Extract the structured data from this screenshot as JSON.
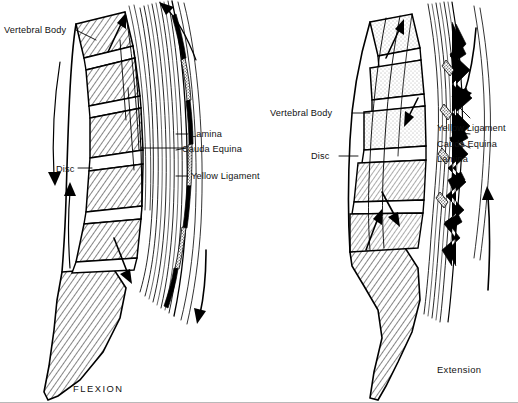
{
  "figure": {
    "background_color": "#ffffff",
    "ink_color": "#000000",
    "panels": [
      {
        "id": "flexion",
        "caption": "FLEXION",
        "labels": [
          {
            "key": "vertebral_body",
            "text": "Vertebral Body"
          },
          {
            "key": "disc",
            "text": "Disc"
          },
          {
            "key": "lamina",
            "text": "Lamina"
          },
          {
            "key": "cauda_equina",
            "text": "Cauda Equina"
          },
          {
            "key": "yellow_ligament",
            "text": "Yellow Ligament"
          }
        ]
      },
      {
        "id": "extension",
        "caption": "Extension",
        "labels": [
          {
            "key": "vertebral_body",
            "text": "Vertebral Body"
          },
          {
            "key": "disc",
            "text": "Disc"
          },
          {
            "key": "yellow_ligament",
            "text": "Yellow Ligament"
          },
          {
            "key": "cauda_equina",
            "text": "Cauda Equina"
          },
          {
            "key": "lamina",
            "text": "Lamina"
          }
        ]
      }
    ]
  }
}
